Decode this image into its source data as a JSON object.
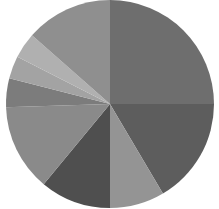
{
  "figure": {
    "width": 219,
    "height": 209,
    "background": "#ffffff"
  },
  "chart_data": {
    "type": "pie",
    "title": "",
    "subtitle": "",
    "xlabel": "",
    "ylabel": "",
    "legend": false,
    "legend_position": "none",
    "grid": false,
    "labels_shown": false,
    "palette": "grayscale",
    "center_x": 110,
    "center_y": 104,
    "radius": 104,
    "start_angle_deg": 90,
    "direction": "clockwise",
    "total": 100,
    "categories": [
      "Slice 1",
      "Slice 2",
      "Slice 3",
      "Slice 4",
      "Slice 5",
      "Slice 6",
      "Slice 7",
      "Slice 8",
      "Slice 9"
    ],
    "values": [
      25.0,
      16.5,
      8.5,
      11.0,
      13.5,
      4.5,
      3.5,
      4.0,
      13.5
    ],
    "colors": [
      "#6e6e6e",
      "#5d5d5d",
      "#949494",
      "#4f4f4f",
      "#8a8a8a",
      "#7c7c7c",
      "#a3a3a3",
      "#b0b0b0",
      "#8f8f8f"
    ],
    "slices": [
      {
        "label": "Slice 1",
        "value": 25.0,
        "color": "#6e6e6e",
        "start_deg": 90.0,
        "end_deg": 0.0
      },
      {
        "label": "Slice 2",
        "value": 16.5,
        "color": "#5d5d5d",
        "start_deg": 0.0,
        "end_deg": -59.4
      },
      {
        "label": "Slice 3",
        "value": 8.5,
        "color": "#949494",
        "start_deg": -59.4,
        "end_deg": -90.0
      },
      {
        "label": "Slice 4",
        "value": 11.0,
        "color": "#4f4f4f",
        "start_deg": -90.0,
        "end_deg": -129.6
      },
      {
        "label": "Slice 5",
        "value": 13.5,
        "color": "#8a8a8a",
        "start_deg": -129.6,
        "end_deg": -178.2
      },
      {
        "label": "Slice 6",
        "value": 4.5,
        "color": "#7c7c7c",
        "start_deg": -178.2,
        "end_deg": -194.4
      },
      {
        "label": "Slice 7",
        "value": 3.5,
        "color": "#a3a3a3",
        "start_deg": -194.4,
        "end_deg": -207.0
      },
      {
        "label": "Slice 8",
        "value": 4.0,
        "color": "#b0b0b0",
        "start_deg": -207.0,
        "end_deg": -221.4
      },
      {
        "label": "Slice 9",
        "value": 13.5,
        "color": "#8f8f8f",
        "start_deg": -221.4,
        "end_deg": -270.0
      }
    ]
  }
}
